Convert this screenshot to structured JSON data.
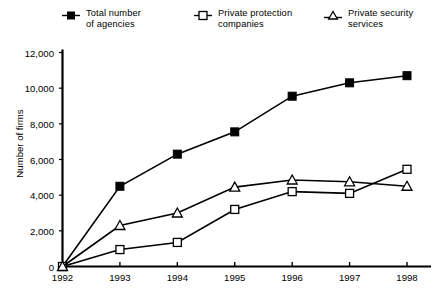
{
  "chart_data": {
    "type": "line",
    "title": "",
    "xlabel": "",
    "ylabel": "Number of firms",
    "categories": [
      "1992",
      "1993",
      "1994",
      "1995",
      "1996",
      "1997",
      "1998"
    ],
    "ylim": [
      0,
      12000
    ],
    "ytick_values": [
      0,
      2000,
      4000,
      6000,
      8000,
      10000,
      12000
    ],
    "ytick_labels": [
      "0",
      "2,000",
      "4,000",
      "6,000",
      "8,000",
      "10,000",
      "12,000"
    ],
    "grid": false,
    "legend_position": "top",
    "series": [
      {
        "name": "Total number of agencies",
        "marker": "filled-square",
        "color": "#000000",
        "values": [
          0,
          4500,
          6300,
          7550,
          9550,
          10300,
          10700
        ]
      },
      {
        "name": "Private protection companies",
        "marker": "open-square",
        "color": "#000000",
        "values": [
          0,
          950,
          1350,
          3200,
          4200,
          4100,
          5450
        ]
      },
      {
        "name": "Private security services",
        "marker": "open-triangle",
        "color": "#000000",
        "values": [
          0,
          2300,
          3000,
          4450,
          4850,
          4750,
          4500
        ]
      }
    ]
  },
  "legend": {
    "items": [
      {
        "label": "Total number\nof agencies",
        "marker": "filled-square"
      },
      {
        "label": "Private protection\ncompanies",
        "marker": "open-square"
      },
      {
        "label": "Private security\nservices",
        "marker": "open-triangle"
      }
    ]
  },
  "axes": {
    "y_title": "Number of firms"
  }
}
